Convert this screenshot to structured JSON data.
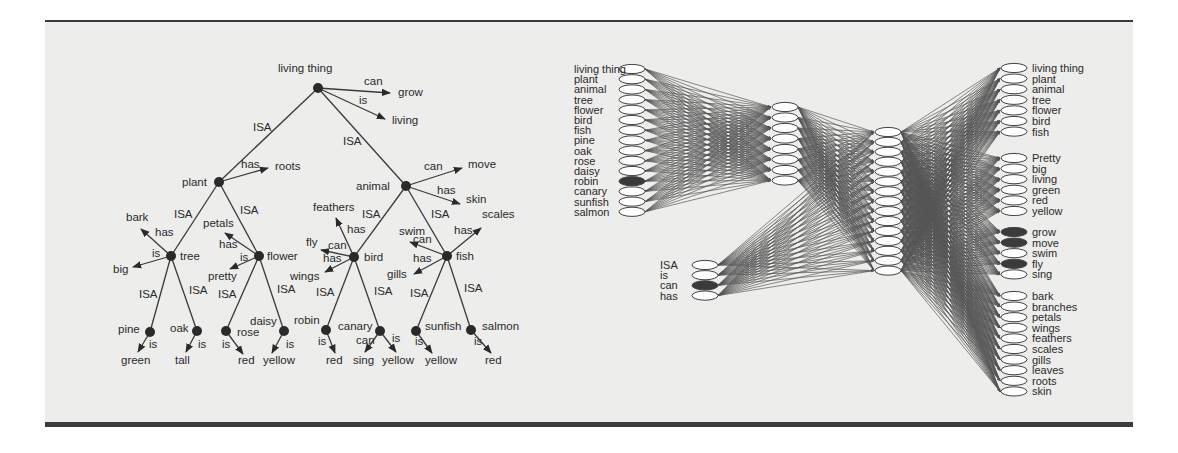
{
  "semantic_tree": {
    "nodes": [
      {
        "id": "living thing",
        "x": 318,
        "y": 88,
        "lx": 278,
        "ly": 72,
        "anchor": "start"
      },
      {
        "id": "plant",
        "x": 219,
        "y": 182,
        "lx": 182,
        "ly": 186,
        "anchor": "start"
      },
      {
        "id": "animal",
        "x": 406,
        "y": 186,
        "lx": 356,
        "ly": 190,
        "anchor": "start"
      },
      {
        "id": "tree",
        "x": 171,
        "y": 256,
        "lx": 180,
        "ly": 260,
        "anchor": "start"
      },
      {
        "id": "flower",
        "x": 259,
        "y": 256,
        "lx": 267,
        "ly": 260,
        "anchor": "start"
      },
      {
        "id": "bird",
        "x": 354,
        "y": 257,
        "lx": 364,
        "ly": 261,
        "anchor": "start"
      },
      {
        "id": "fish",
        "x": 447,
        "y": 256,
        "lx": 456,
        "ly": 260,
        "anchor": "start"
      },
      {
        "id": "pine",
        "x": 150,
        "y": 332,
        "lx": 118,
        "ly": 333,
        "anchor": "start"
      },
      {
        "id": "oak",
        "x": 197,
        "y": 331,
        "lx": 170,
        "ly": 332,
        "anchor": "start"
      },
      {
        "id": "rose",
        "x": 226,
        "y": 331,
        "lx": 237,
        "ly": 336,
        "anchor": "start"
      },
      {
        "id": "daisy",
        "x": 284,
        "y": 331,
        "lx": 250,
        "ly": 325,
        "anchor": "start"
      },
      {
        "id": "robin",
        "x": 326,
        "y": 330,
        "lx": 294,
        "ly": 324,
        "anchor": "start"
      },
      {
        "id": "canary",
        "x": 380,
        "y": 331,
        "lx": 338,
        "ly": 330,
        "anchor": "start"
      },
      {
        "id": "sunfish",
        "x": 416,
        "y": 331,
        "lx": 425,
        "ly": 330,
        "anchor": "start"
      },
      {
        "id": "salmon",
        "x": 471,
        "y": 330,
        "lx": 482,
        "ly": 330,
        "anchor": "start"
      }
    ],
    "isa_links": [
      {
        "from": "living thing",
        "to": "plant",
        "label": "ISA",
        "lx": 253,
        "ly": 131
      },
      {
        "from": "living thing",
        "to": "animal",
        "label": "ISA",
        "lx": 343,
        "ly": 145
      },
      {
        "from": "plant",
        "to": "tree",
        "label": "ISA",
        "lx": 174,
        "ly": 218
      },
      {
        "from": "plant",
        "to": "flower",
        "label": "ISA",
        "lx": 240,
        "ly": 214
      },
      {
        "from": "animal",
        "to": "bird",
        "label": "ISA",
        "lx": 362,
        "ly": 218
      },
      {
        "from": "animal",
        "to": "fish",
        "label": "ISA",
        "lx": 431,
        "ly": 218
      },
      {
        "from": "tree",
        "to": "pine",
        "label": "ISA",
        "lx": 139,
        "ly": 298
      },
      {
        "from": "tree",
        "to": "oak",
        "label": "ISA",
        "lx": 189,
        "ly": 294
      },
      {
        "from": "flower",
        "to": "rose",
        "label": "ISA",
        "lx": 218,
        "ly": 298
      },
      {
        "from": "flower",
        "to": "daisy",
        "label": "ISA",
        "lx": 277,
        "ly": 293
      },
      {
        "from": "bird",
        "to": "robin",
        "label": "ISA",
        "lx": 316,
        "ly": 296
      },
      {
        "from": "bird",
        "to": "canary",
        "label": "ISA",
        "lx": 374,
        "ly": 295
      },
      {
        "from": "fish",
        "to": "sunfish",
        "label": "ISA",
        "lx": 410,
        "ly": 297
      },
      {
        "from": "fish",
        "to": "salmon",
        "label": "ISA",
        "lx": 464,
        "ly": 292
      }
    ],
    "property_links": [
      {
        "from": "living thing",
        "rel": "can",
        "target": "grow",
        "tx": 398,
        "ty": 96,
        "ax": 390,
        "ay": 93,
        "rx": 364,
        "ry": 85,
        "ta": "start"
      },
      {
        "from": "living thing",
        "rel": "is",
        "target": "living",
        "tx": 392,
        "ty": 124,
        "ax": 385,
        "ay": 119,
        "rx": 359,
        "ry": 104,
        "ta": "start"
      },
      {
        "from": "plant",
        "rel": "has",
        "target": "roots",
        "tx": 275,
        "ty": 170,
        "ax": 268,
        "ay": 168,
        "rx": 241,
        "ry": 168,
        "ta": "start"
      },
      {
        "from": "animal",
        "rel": "can",
        "target": "move",
        "tx": 468,
        "ty": 168,
        "ax": 462,
        "ay": 168,
        "rx": 424,
        "ry": 170,
        "ta": "start"
      },
      {
        "from": "animal",
        "rel": "has",
        "target": "skin",
        "tx": 466,
        "ty": 203,
        "ax": 460,
        "ay": 204,
        "rx": 437,
        "ry": 194,
        "ta": "start"
      },
      {
        "from": "tree",
        "rel": "has",
        "target": "bark",
        "tx": 126,
        "ty": 221,
        "ax": 141,
        "ay": 229,
        "rx": 155,
        "ry": 236,
        "ta": "start"
      },
      {
        "from": "tree",
        "rel": "is",
        "target": "big",
        "tx": 113,
        "ty": 273,
        "ax": 133,
        "ay": 267,
        "rx": 152,
        "ry": 257,
        "ta": "start"
      },
      {
        "from": "flower",
        "rel": "has",
        "target": "petals",
        "tx": 203,
        "ty": 227,
        "ax": 225,
        "ay": 233,
        "rx": 219,
        "ry": 248,
        "ta": "start"
      },
      {
        "from": "flower",
        "rel": "is",
        "target": "pretty",
        "tx": 208,
        "ty": 280,
        "ax": 230,
        "ay": 269,
        "rx": 240,
        "ry": 261,
        "ta": "start"
      },
      {
        "from": "bird",
        "rel": "has",
        "target": "feathers",
        "tx": 313,
        "ty": 211,
        "ax": 336,
        "ay": 218,
        "rx": 347,
        "ry": 233,
        "ta": "start"
      },
      {
        "from": "bird",
        "rel": "can",
        "target": "fly",
        "tx": 306,
        "ty": 246,
        "ax": 321,
        "ay": 250,
        "rx": 328,
        "ry": 249,
        "ta": "start"
      },
      {
        "from": "bird",
        "rel": "has",
        "target": "wings",
        "tx": 290,
        "ty": 280,
        "ax": 325,
        "ay": 272,
        "rx": 323,
        "ry": 262,
        "ta": "start"
      },
      {
        "from": "fish",
        "rel": "can",
        "target": "swim",
        "tx": 399,
        "ty": 235,
        "ax": 410,
        "ay": 242,
        "rx": 413,
        "ry": 243,
        "ta": "start"
      },
      {
        "from": "fish",
        "rel": "has",
        "target": "gills",
        "tx": 387,
        "ty": 278,
        "ax": 414,
        "ay": 274,
        "rx": 413,
        "ry": 262,
        "ta": "start"
      },
      {
        "from": "fish",
        "rel": "has",
        "target": "scales",
        "tx": 482,
        "ty": 218,
        "ax": 481,
        "ay": 228,
        "rx": 454,
        "ry": 234,
        "ta": "start"
      },
      {
        "from": "pine",
        "rel": "is",
        "target": "green",
        "tx": 121,
        "ty": 364,
        "ax": 138,
        "ay": 352,
        "rx": 149,
        "ry": 348,
        "ta": "start"
      },
      {
        "from": "oak",
        "rel": "is",
        "target": "tall",
        "tx": 175,
        "ty": 364,
        "ax": 186,
        "ay": 352,
        "rx": 198,
        "ry": 348,
        "ta": "start"
      },
      {
        "from": "rose",
        "rel": "is",
        "target": "red",
        "tx": 238,
        "ty": 364,
        "ax": 243,
        "ay": 354,
        "rx": 222,
        "ry": 348,
        "ta": "start"
      },
      {
        "from": "daisy",
        "rel": "is",
        "target": "yellow",
        "tx": 263,
        "ty": 364,
        "ax": 272,
        "ay": 353,
        "rx": 286,
        "ry": 348,
        "ta": "start"
      },
      {
        "from": "robin",
        "rel": "is",
        "target": "red",
        "tx": 326,
        "ty": 364,
        "ax": 335,
        "ay": 353,
        "rx": 318,
        "ry": 345,
        "ta": "start"
      },
      {
        "from": "canary",
        "rel": "can",
        "target": "sing",
        "tx": 353,
        "ty": 364,
        "ax": 365,
        "ay": 352,
        "rx": 356,
        "ry": 344,
        "ta": "start"
      },
      {
        "from": "canary",
        "rel": "is",
        "target": "yellow",
        "tx": 382,
        "ty": 364,
        "ax": 396,
        "ay": 352,
        "rx": 392,
        "ry": 342,
        "ta": "start"
      },
      {
        "from": "sunfish",
        "rel": "is",
        "target": "yellow",
        "tx": 425,
        "ty": 364,
        "ax": 432,
        "ay": 353,
        "rx": 415,
        "ry": 345,
        "ta": "start"
      },
      {
        "from": "salmon",
        "rel": "is",
        "target": "red",
        "tx": 485,
        "ty": 364,
        "ax": 491,
        "ay": 353,
        "rx": 474,
        "ry": 345,
        "ta": "start"
      }
    ]
  },
  "network": {
    "item_layer": {
      "labels": [
        "living thing",
        "plant",
        "animal",
        "tree",
        "flower",
        "bird",
        "fish",
        "pine",
        "oak",
        "rose",
        "daisy",
        "robin",
        "canary",
        "sunfish",
        "salmon"
      ],
      "active": [
        "robin"
      ]
    },
    "relation_layer": {
      "labels": [
        "ISA",
        "is",
        "can",
        "has"
      ],
      "active": [
        "can"
      ]
    },
    "representation_units": 8,
    "hidden_units": 15,
    "output_groups": [
      {
        "name": "isa",
        "labels": [
          "living thing",
          "plant",
          "animal",
          "tree",
          "flower",
          "bird",
          "fish"
        ],
        "active": []
      },
      {
        "name": "is",
        "labels": [
          "Pretty",
          "big",
          "living",
          "green",
          "red",
          "yellow"
        ],
        "active": []
      },
      {
        "name": "can",
        "labels": [
          "grow",
          "move",
          "swim",
          "fly",
          "sing"
        ],
        "active": [
          "grow",
          "move",
          "fly"
        ]
      },
      {
        "name": "has",
        "labels": [
          "bark",
          "branches",
          "petals",
          "wings",
          "feathers",
          "scales",
          "gills",
          "leaves",
          "roots",
          "skin"
        ],
        "active": []
      }
    ]
  },
  "colors": {
    "panel_background": "#ededeb",
    "rule": "#3a3a3a",
    "ink": "#2a2a2a"
  }
}
